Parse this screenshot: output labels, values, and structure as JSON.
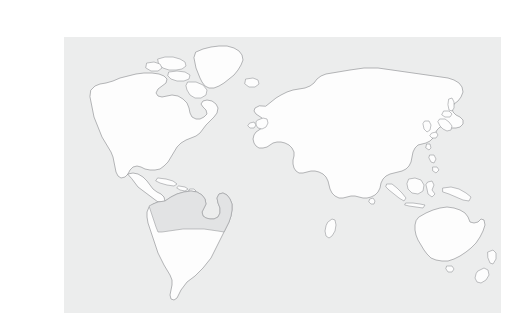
{
  "figure": {
    "kind": "world-map",
    "title": "World map",
    "description": "Outline world map with one highlighted region in South America",
    "canvas": {
      "width": 485,
      "height": 308
    }
  },
  "colors": {
    "page_background": "#ffffff",
    "ocean_background": "#eceded",
    "land_fill": "#fdfdfd",
    "land_outline": "#8e9093",
    "highlight_fill": "#e2e3e4",
    "highlight_outline": "#9a9c9f"
  },
  "map_frame": {
    "left": 24,
    "top": 21,
    "width": 437,
    "height": 276
  },
  "highlight": {
    "label": "south-america-highlight",
    "region_name": "Northern and central South America",
    "excluded_name": "Southern cone",
    "fill": "#e2e3e4"
  },
  "landmasses": [
    {
      "id": "north-america",
      "label": "North America"
    },
    {
      "id": "greenland",
      "label": "Greenland"
    },
    {
      "id": "arctic-islands",
      "label": "Canadian Arctic Islands"
    },
    {
      "id": "iceland",
      "label": "Iceland"
    },
    {
      "id": "central-america",
      "label": "Central America"
    },
    {
      "id": "caribbean",
      "label": "Caribbean Islands"
    },
    {
      "id": "south-america",
      "label": "South America"
    },
    {
      "id": "eurasia",
      "label": "Eurasia"
    },
    {
      "id": "africa",
      "label": "Africa"
    },
    {
      "id": "madagascar",
      "label": "Madagascar"
    },
    {
      "id": "british-isles",
      "label": "British Isles"
    },
    {
      "id": "japan",
      "label": "Japan"
    },
    {
      "id": "philippines",
      "label": "Philippines"
    },
    {
      "id": "indonesia",
      "label": "Indonesia"
    },
    {
      "id": "new-guinea",
      "label": "New Guinea"
    },
    {
      "id": "australia",
      "label": "Australia"
    },
    {
      "id": "tasmania",
      "label": "Tasmania"
    },
    {
      "id": "new-zealand",
      "label": "New Zealand"
    },
    {
      "id": "sri-lanka",
      "label": "Sri Lanka"
    },
    {
      "id": "sakhalin",
      "label": "Sakhalin"
    }
  ]
}
